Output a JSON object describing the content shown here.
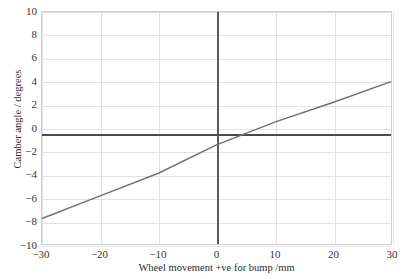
{
  "chart_data": {
    "type": "line",
    "title": "",
    "xlabel": "Wheel movement +ve for bump /mm",
    "ylabel": "Camber angle / degrees",
    "xlim": [
      -30,
      30
    ],
    "ylim": [
      -10,
      10
    ],
    "xticks": [
      -30,
      -20,
      -10,
      0,
      10,
      20,
      30
    ],
    "xtick_labels": [
      "−30",
      "−20",
      "−10",
      "0",
      "10",
      "20",
      "30"
    ],
    "yticks": [
      10,
      8,
      6,
      4,
      2,
      0,
      -2,
      -4,
      -6,
      -8,
      -10
    ],
    "ytick_labels": [
      "10",
      "8",
      "6",
      "4",
      "2",
      "0",
      "−2",
      "−4",
      "−6",
      "−8",
      "−10"
    ],
    "grid": true,
    "grid_color": "#e3e3e3",
    "legend": false,
    "series": [
      {
        "name": "Camber angle",
        "type": "line",
        "color": "#707070",
        "x": [
          -30,
          -20,
          -10,
          0,
          10,
          20,
          30
        ],
        "values": [
          -7.8,
          -5.85,
          -3.9,
          -1.45,
          0.5,
          2.2,
          4.0
        ]
      },
      {
        "name": "Reference level",
        "type": "hline",
        "color": "#4a4a4a",
        "y": -0.5
      }
    ],
    "annotations": [
      {
        "name": "zero-vertical-axis",
        "x": 0,
        "color": "#5a5a5a"
      }
    ]
  }
}
